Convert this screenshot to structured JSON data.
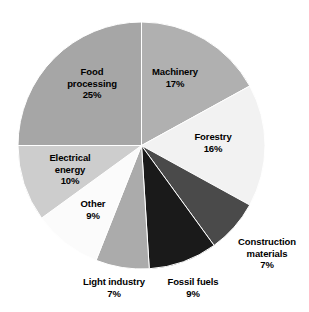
{
  "chart_data": {
    "type": "pie",
    "title": "",
    "subtitle": "",
    "xlabel": "",
    "ylabel": "",
    "legend_position": "none",
    "grid": false,
    "unit": "%",
    "start_angle_deg": 0,
    "direction": "clockwise",
    "categories": [
      "Machinery",
      "Forestry",
      "Construction materials",
      "Fossil fuels",
      "Light industry",
      "Other",
      "Electrical energy",
      "Food processing"
    ],
    "values": [
      17,
      16,
      7,
      9,
      7,
      9,
      10,
      25
    ],
    "colors": [
      "#b0b0b0",
      "#f2f2f2",
      "#4a4a4a",
      "#1a1a1a",
      "#ababab",
      "#fbfbfb",
      "#cdcdcd",
      "#a6a6a6"
    ],
    "slices": [
      {
        "name": "Machinery",
        "value": 17,
        "value_label": "17%",
        "color": "#b0b0b0",
        "label_placement": "inside",
        "label_lines": [
          "Machinery",
          "17%"
        ]
      },
      {
        "name": "Forestry",
        "value": 16,
        "value_label": "16%",
        "color": "#f2f2f2",
        "label_placement": "inside",
        "label_lines": [
          "Forestry",
          "16%"
        ]
      },
      {
        "name": "Construction materials",
        "value": 7,
        "value_label": "7%",
        "color": "#4a4a4a",
        "label_placement": "outside",
        "label_lines": [
          "Construction",
          "materials",
          "7%"
        ]
      },
      {
        "name": "Fossil fuels",
        "value": 9,
        "value_label": "9%",
        "color": "#1a1a1a",
        "label_placement": "outside",
        "label_lines": [
          "Fossil fuels",
          "9%"
        ]
      },
      {
        "name": "Light industry",
        "value": 7,
        "value_label": "7%",
        "color": "#ababab",
        "label_placement": "outside",
        "label_lines": [
          "Light industry",
          "7%"
        ]
      },
      {
        "name": "Other",
        "value": 9,
        "value_label": "9%",
        "color": "#fbfbfb",
        "label_placement": "inside",
        "label_lines": [
          "Other",
          "9%"
        ]
      },
      {
        "name": "Electrical energy",
        "value": 10,
        "value_label": "10%",
        "color": "#cdcdcd",
        "label_placement": "inside",
        "label_lines": [
          "Electrical",
          "energy",
          "10%"
        ]
      },
      {
        "name": "Food processing",
        "value": 25,
        "value_label": "25%",
        "color": "#a6a6a6",
        "label_placement": "inside",
        "label_lines": [
          "Food",
          "processing",
          "25%"
        ]
      }
    ]
  },
  "labels": {
    "machinery": "Machinery\n17%",
    "forestry": "Forestry\n16%",
    "construction_materials": "Construction\nmaterials\n7%",
    "fossil_fuels": "Fossil fuels\n9%",
    "light_industry": "Light industry\n7%",
    "other": "Other\n9%",
    "electrical_energy": "Electrical\nenergy\n10%",
    "food_processing": "Food\nprocessing\n25%"
  }
}
